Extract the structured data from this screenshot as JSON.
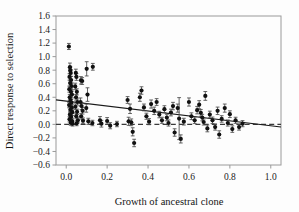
{
  "chart_data": {
    "type": "scatter",
    "title": "",
    "xlabel": "Growth of ancestral clone",
    "ylabel": "Direct response to selection",
    "xlim": [
      -0.05,
      1.05
    ],
    "ylim": [
      -0.6,
      1.6
    ],
    "xticks": [
      0.0,
      0.2,
      0.4,
      0.6,
      0.8,
      1.0
    ],
    "xtick_labels": [
      "0.0",
      "0.2",
      "0.4",
      "0.6",
      "0.8",
      "1.0"
    ],
    "yticks": [
      -0.6,
      -0.4,
      -0.2,
      0.0,
      0.2,
      0.4,
      0.6,
      0.8,
      1.0,
      1.2,
      1.4,
      1.6
    ],
    "ytick_labels": [
      "-0.6",
      "-0.4",
      "-0.2",
      "0.0",
      "0.2",
      "0.4",
      "0.6",
      "0.8",
      "1.0",
      "1.2",
      "1.4",
      "1.6"
    ],
    "grid": false,
    "legend": null,
    "marker": "filled-circle",
    "marker_color": "#111111",
    "errorbar_color": "#4a4a4a",
    "frame_color": "#9a9a9a",
    "reference_line": {
      "name": "zero-line",
      "orientation": "horizontal",
      "y": 0.0,
      "style": "dashed",
      "color": "#3a3a3a"
    },
    "trend_line": {
      "name": "regression-line",
      "style": "solid",
      "color": "#1a1a1a",
      "x_start": -0.05,
      "y_start": 0.362,
      "x_end": 1.05,
      "y_end": -0.038
    },
    "points": [
      {
        "x": 0.013,
        "y": 1.15,
        "yerr": 0.045
      },
      {
        "x": 0.018,
        "y": 0.845,
        "yerr": 0.06
      },
      {
        "x": 0.02,
        "y": 0.8,
        "yerr": 0.055
      },
      {
        "x": 0.022,
        "y": 0.76,
        "yerr": 0.05
      },
      {
        "x": 0.016,
        "y": 0.7,
        "yerr": 0.048
      },
      {
        "x": 0.024,
        "y": 0.655,
        "yerr": 0.052
      },
      {
        "x": 0.019,
        "y": 0.61,
        "yerr": 0.045
      },
      {
        "x": 0.026,
        "y": 0.565,
        "yerr": 0.05
      },
      {
        "x": 0.015,
        "y": 0.52,
        "yerr": 0.045
      },
      {
        "x": 0.023,
        "y": 0.48,
        "yerr": 0.048
      },
      {
        "x": 0.028,
        "y": 0.44,
        "yerr": 0.05
      },
      {
        "x": 0.017,
        "y": 0.4,
        "yerr": 0.042
      },
      {
        "x": 0.021,
        "y": 0.36,
        "yerr": 0.045
      },
      {
        "x": 0.025,
        "y": 0.32,
        "yerr": 0.048
      },
      {
        "x": 0.014,
        "y": 0.285,
        "yerr": 0.04
      },
      {
        "x": 0.027,
        "y": 0.25,
        "yerr": 0.045
      },
      {
        "x": 0.02,
        "y": 0.215,
        "yerr": 0.042
      },
      {
        "x": 0.03,
        "y": 0.18,
        "yerr": 0.048
      },
      {
        "x": 0.018,
        "y": 0.145,
        "yerr": 0.04
      },
      {
        "x": 0.024,
        "y": 0.11,
        "yerr": 0.042
      },
      {
        "x": 0.016,
        "y": 0.075,
        "yerr": 0.038
      },
      {
        "x": 0.029,
        "y": 0.05,
        "yerr": 0.04
      },
      {
        "x": 0.022,
        "y": 0.025,
        "yerr": 0.038
      },
      {
        "x": 0.031,
        "y": 0.01,
        "yerr": 0.035
      },
      {
        "x": 0.047,
        "y": 0.76,
        "yerr": 0.055
      },
      {
        "x": 0.05,
        "y": 0.7,
        "yerr": 0.05
      },
      {
        "x": 0.044,
        "y": 0.56,
        "yerr": 0.048
      },
      {
        "x": 0.052,
        "y": 0.48,
        "yerr": 0.045
      },
      {
        "x": 0.048,
        "y": 0.4,
        "yerr": 0.042
      },
      {
        "x": 0.055,
        "y": 0.33,
        "yerr": 0.045
      },
      {
        "x": 0.045,
        "y": 0.26,
        "yerr": 0.042
      },
      {
        "x": 0.053,
        "y": 0.185,
        "yerr": 0.04
      },
      {
        "x": 0.049,
        "y": 0.12,
        "yerr": 0.038
      },
      {
        "x": 0.057,
        "y": 0.06,
        "yerr": 0.038
      },
      {
        "x": 0.051,
        "y": 0.015,
        "yerr": 0.035
      },
      {
        "x": 0.072,
        "y": 0.65,
        "yerr": 0.055
      },
      {
        "x": 0.078,
        "y": 0.64,
        "yerr": 0.05
      },
      {
        "x": 0.07,
        "y": 0.33,
        "yerr": 0.06
      },
      {
        "x": 0.075,
        "y": 0.27,
        "yerr": 0.05
      },
      {
        "x": 0.08,
        "y": 0.2,
        "yerr": 0.048
      },
      {
        "x": 0.073,
        "y": 0.12,
        "yerr": 0.042
      },
      {
        "x": 0.082,
        "y": 0.055,
        "yerr": 0.04
      },
      {
        "x": 0.1,
        "y": 0.82,
        "yerr": 0.105
      },
      {
        "x": 0.104,
        "y": 0.44,
        "yerr": 0.1
      },
      {
        "x": 0.098,
        "y": 0.24,
        "yerr": 0.06
      },
      {
        "x": 0.108,
        "y": 0.045,
        "yerr": 0.045
      },
      {
        "x": 0.13,
        "y": 0.85,
        "yerr": 0.05
      },
      {
        "x": 0.128,
        "y": 0.02,
        "yerr": 0.04
      },
      {
        "x": 0.165,
        "y": 0.06,
        "yerr": 0.055
      },
      {
        "x": 0.172,
        "y": 0.01,
        "yerr": 0.05
      },
      {
        "x": 0.2,
        "y": 0.05,
        "yerr": 0.05
      },
      {
        "x": 0.215,
        "y": -0.02,
        "yerr": 0.045
      },
      {
        "x": 0.248,
        "y": 0.005,
        "yerr": 0.04
      },
      {
        "x": 0.3,
        "y": 0.36,
        "yerr": 0.05
      },
      {
        "x": 0.305,
        "y": 0.045,
        "yerr": 0.06
      },
      {
        "x": 0.312,
        "y": 0.23,
        "yerr": 0.07
      },
      {
        "x": 0.318,
        "y": 0.03,
        "yerr": 0.05
      },
      {
        "x": 0.325,
        "y": -0.11,
        "yerr": 0.06
      },
      {
        "x": 0.332,
        "y": -0.275,
        "yerr": 0.055
      },
      {
        "x": 0.36,
        "y": 0.4,
        "yerr": 0.06
      },
      {
        "x": 0.368,
        "y": 0.5,
        "yerr": 0.055
      },
      {
        "x": 0.38,
        "y": 0.25,
        "yerr": 0.05
      },
      {
        "x": 0.392,
        "y": 0.12,
        "yerr": 0.045
      },
      {
        "x": 0.405,
        "y": 0.04,
        "yerr": 0.045
      },
      {
        "x": 0.415,
        "y": 0.3,
        "yerr": 0.06
      },
      {
        "x": 0.43,
        "y": 0.2,
        "yerr": 0.055
      },
      {
        "x": 0.442,
        "y": 0.33,
        "yerr": 0.05
      },
      {
        "x": 0.455,
        "y": 0.145,
        "yerr": 0.048
      },
      {
        "x": 0.468,
        "y": 0.06,
        "yerr": 0.045
      },
      {
        "x": 0.48,
        "y": 0.225,
        "yerr": 0.05
      },
      {
        "x": 0.492,
        "y": 0.1,
        "yerr": 0.048
      },
      {
        "x": 0.5,
        "y": 0.02,
        "yerr": 0.045
      },
      {
        "x": 0.512,
        "y": 0.175,
        "yerr": 0.05
      },
      {
        "x": 0.522,
        "y": 0.27,
        "yerr": 0.055
      },
      {
        "x": 0.53,
        "y": -0.12,
        "yerr": 0.055
      },
      {
        "x": 0.545,
        "y": 0.24,
        "yerr": 0.06
      },
      {
        "x": 0.552,
        "y": 0.085,
        "yerr": 0.31
      },
      {
        "x": 0.56,
        "y": -0.215,
        "yerr": 0.06
      },
      {
        "x": 0.575,
        "y": 0.04,
        "yerr": 0.05
      },
      {
        "x": 0.6,
        "y": 0.33,
        "yerr": 0.06
      },
      {
        "x": 0.612,
        "y": 0.12,
        "yerr": 0.05
      },
      {
        "x": 0.628,
        "y": 0.06,
        "yerr": 0.048
      },
      {
        "x": 0.64,
        "y": 0.21,
        "yerr": 0.055
      },
      {
        "x": 0.65,
        "y": 0.29,
        "yerr": 0.06
      },
      {
        "x": 0.658,
        "y": 0.17,
        "yerr": 0.05
      },
      {
        "x": 0.665,
        "y": 0.1,
        "yerr": 0.048
      },
      {
        "x": 0.672,
        "y": 0.035,
        "yerr": 0.045
      },
      {
        "x": 0.68,
        "y": 0.42,
        "yerr": 0.065
      },
      {
        "x": 0.69,
        "y": -0.06,
        "yerr": 0.05
      },
      {
        "x": 0.702,
        "y": 0.145,
        "yerr": 0.05
      },
      {
        "x": 0.715,
        "y": 0.06,
        "yerr": 0.048
      },
      {
        "x": 0.728,
        "y": -0.04,
        "yerr": 0.045
      },
      {
        "x": 0.74,
        "y": 0.2,
        "yerr": 0.055
      },
      {
        "x": 0.748,
        "y": -0.15,
        "yerr": 0.055
      },
      {
        "x": 0.76,
        "y": 0.08,
        "yerr": 0.048
      },
      {
        "x": 0.775,
        "y": 0.24,
        "yerr": 0.06
      },
      {
        "x": 0.79,
        "y": 0.02,
        "yerr": 0.045
      },
      {
        "x": 0.8,
        "y": 0.15,
        "yerr": 0.05
      },
      {
        "x": 0.812,
        "y": -0.07,
        "yerr": 0.048
      },
      {
        "x": 0.828,
        "y": 0.06,
        "yerr": 0.045
      },
      {
        "x": 0.845,
        "y": -0.04,
        "yerr": 0.045
      },
      {
        "x": 0.862,
        "y": 0.01,
        "yerr": 0.045
      }
    ]
  }
}
